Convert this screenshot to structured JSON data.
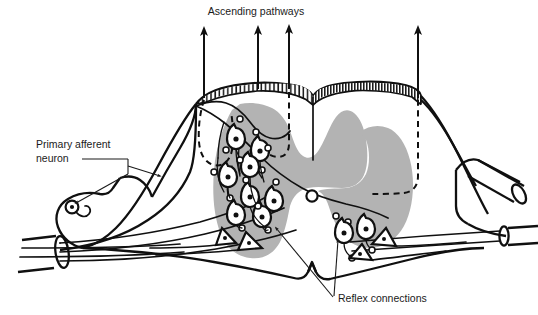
{
  "figure": {
    "background_color": "#ffffff",
    "ink_color": "#101010",
    "grey_matter_color": "#b3b3b3",
    "width": 538,
    "height": 315
  },
  "labels": {
    "ascending_pathways": "Ascending pathways",
    "primary_afferent_line1": "Primary afferent",
    "primary_afferent_line2": "neuron",
    "reflex_connections": "Reflex connections"
  },
  "annotations": {
    "ascending_arrow_count": 4,
    "ascending_arrow_x": [
      204,
      258,
      289,
      418
    ],
    "dashed_tract_count": 3
  },
  "structures": {
    "dorsal_column_band": "hatched-dorsal-column",
    "grey_matter": "butterfly-grey-matter",
    "dorsal_root_ganglion": "dorsal-root-ganglion",
    "dorsal_root": "dorsal-root",
    "ventral_root": "ventral-root",
    "median_septum": "posterior-median-septum"
  },
  "icons": {
    "arrow_up": "arrow-up-icon",
    "neuron_soma": "neuron-soma-icon",
    "motor_neuron": "motor-neuron-icon",
    "bouton": "synaptic-bouton-icon"
  }
}
